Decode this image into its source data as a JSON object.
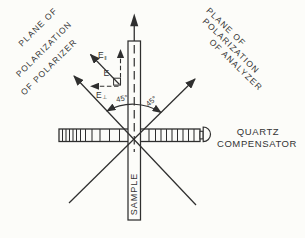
{
  "figure": {
    "colors": {
      "ink": "#2f2f2f",
      "background": "#fcfcf9"
    },
    "polarizer_plane": {
      "lines": [
        "PLANE OF",
        "POLARIZATION",
        "OF POLARIZER"
      ]
    },
    "analyzer_plane": {
      "lines": [
        "PLANE OF",
        "POLARIZATION",
        "OF ANALYZER"
      ]
    },
    "compensator": {
      "lines": [
        "QUARTZ",
        "COMPENSATOR"
      ]
    },
    "sample": {
      "label": "SAMPLE"
    },
    "angles": {
      "left": "45°",
      "right": "45°"
    },
    "vectors": {
      "e_parallel": {
        "base": "E",
        "sub": "‖"
      },
      "e_resultant": {
        "base": "E"
      },
      "e_perp": {
        "base": "E",
        "sub": "⊥"
      }
    }
  }
}
